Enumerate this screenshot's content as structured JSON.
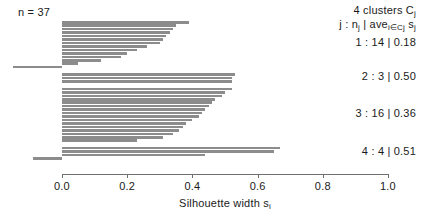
{
  "plot": {
    "n_label": "n = 37",
    "xlabel": "Silhouette width s",
    "xlabel_sub": "i",
    "axis": {
      "min": 0.0,
      "max": 1.0,
      "ticks": [
        0.0,
        0.2,
        0.4,
        0.6,
        0.8,
        1.0
      ],
      "tick_labels": [
        "0.0",
        "0.2",
        "0.4",
        "0.6",
        "0.8",
        "1.0"
      ]
    },
    "bar_color": "#8c8c8c",
    "axis_color": "#6f6f6f"
  },
  "legend": {
    "title": "4 clusters C",
    "title_sub": "j",
    "subtitle_pre": "j : n",
    "subtitle_sub1": "j",
    "subtitle_mid": " | ave",
    "subtitle_sub2": "i∈Cj",
    "subtitle_post": " s",
    "subtitle_sub3": "j",
    "clusters": [
      {
        "id": "1",
        "n": "14",
        "ave": "0.18",
        "text": "1 : 14 | 0.18"
      },
      {
        "id": "2",
        "n": "3",
        "ave": "0.50",
        "text": "2 : 3 | 0.50"
      },
      {
        "id": "3",
        "n": "16",
        "ave": "0.36",
        "text": "3 : 16 | 0.36"
      },
      {
        "id": "4",
        "n": "4",
        "ave": "0.51",
        "text": "4 : 4 | 0.51"
      }
    ]
  },
  "chart_data": {
    "type": "bar",
    "orientation": "horizontal",
    "title": "",
    "xlabel": "Silhouette width s_i",
    "ylabel": "",
    "xlim": [
      -0.2,
      1.0
    ],
    "grid": false,
    "legend_position": "right",
    "total_n": 37,
    "note": "Silhouette plot: each bar is one observation's silhouette width s_i, sorted descending within each cluster.",
    "clusters": [
      {
        "cluster": 1,
        "n": 14,
        "average_silhouette": 0.18,
        "values": [
          0.39,
          0.35,
          0.34,
          0.33,
          0.32,
          0.31,
          0.3,
          0.26,
          0.23,
          0.2,
          0.18,
          0.12,
          0.05,
          -0.15
        ]
      },
      {
        "cluster": 2,
        "n": 3,
        "average_silhouette": 0.5,
        "values": [
          0.53,
          0.52,
          0.52
        ]
      },
      {
        "cluster": 3,
        "n": 16,
        "average_silhouette": 0.36,
        "values": [
          0.52,
          0.5,
          0.49,
          0.47,
          0.46,
          0.45,
          0.44,
          0.43,
          0.42,
          0.4,
          0.38,
          0.37,
          0.36,
          0.34,
          0.31,
          0.23
        ]
      },
      {
        "cluster": 4,
        "n": 4,
        "average_silhouette": 0.51,
        "values": [
          0.67,
          0.65,
          0.44,
          -0.09
        ]
      }
    ]
  }
}
